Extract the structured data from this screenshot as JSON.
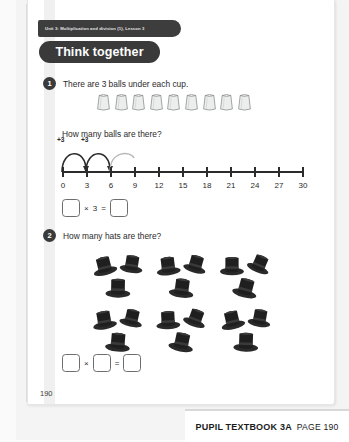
{
  "unit_tab": {
    "label": "Unit 3: Multiplication and division (1), Lesson 3"
  },
  "banner": {
    "title": "Think together"
  },
  "questions": [
    {
      "number": "1",
      "prompt": "There are 3 balls under each cup.",
      "sub_prompt": "How many balls are there?",
      "cup_count": 9,
      "answer_row": {
        "boxes": 2,
        "operator": "×",
        "operand": "3",
        "equals": "="
      }
    },
    {
      "number": "2",
      "prompt": "How many hats are there?",
      "cluster_count": 6,
      "hats_per_cluster": 3,
      "answer_row": {
        "boxes": 3,
        "operator": "×",
        "equals": "="
      }
    }
  ],
  "number_line": {
    "ticks": [
      "0",
      "3",
      "6",
      "9",
      "12",
      "15",
      "18",
      "21",
      "24",
      "27",
      "30"
    ],
    "jump_labels": [
      "+3",
      "+3"
    ],
    "min": 0,
    "max": 30,
    "step": 3
  },
  "page_number": "190",
  "footer": {
    "book": "PUPIL TEXTBOOK 3A",
    "page": "PAGE 190"
  },
  "colors": {
    "ink": "#2b2b2b",
    "banner_bg": "#3a3a3a",
    "box_border": "#6d6d6d",
    "page_bg": "#ffffff"
  }
}
